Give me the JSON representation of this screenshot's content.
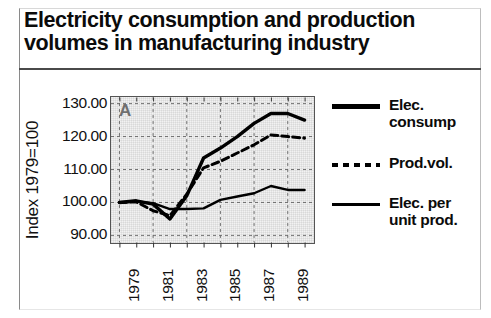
{
  "title": {
    "line1": "Electricity consumption and production",
    "line2": "volumes in manufacturing industry"
  },
  "panel_label": "A",
  "chart_data": {
    "type": "line",
    "title": "Electricity consumption and production volumes in manufacturing industry",
    "panel": "A",
    "xlabel": "",
    "ylabel": "Index 1979=100",
    "x": [
      1979,
      1980,
      1981,
      1982,
      1983,
      1984,
      1985,
      1986,
      1987,
      1988,
      1989,
      1990
    ],
    "xtick_labels": [
      "1979",
      "1981",
      "1983",
      "1985",
      "1987",
      "1989"
    ],
    "xtick_values": [
      1979,
      1981,
      1983,
      1985,
      1987,
      1989
    ],
    "ytick_labels": [
      "130.00",
      "120.00",
      "110.00",
      "100.00",
      "90.00"
    ],
    "ytick_values": [
      130,
      120,
      110,
      100,
      90
    ],
    "ylim": [
      88,
      132
    ],
    "xlim": [
      1978.5,
      1990.5
    ],
    "grid": true,
    "legend_position": "right",
    "series": [
      {
        "name": "Elec. consump",
        "label_lines": [
          "Elec.",
          "consump"
        ],
        "style": "thick-solid",
        "color": "#000000",
        "values": [
          100.0,
          100.5,
          99.5,
          95.0,
          102.0,
          113.5,
          116.5,
          120.0,
          124.0,
          127.0,
          127.0,
          125.0
        ]
      },
      {
        "name": "Prod.vol.",
        "label_lines": [
          "Prod.vol."
        ],
        "style": "dashed",
        "color": "#000000",
        "values": [
          100.0,
          100.2,
          97.5,
          96.0,
          102.5,
          110.5,
          112.5,
          115.0,
          117.5,
          120.5,
          120.0,
          119.5
        ]
      },
      {
        "name": "Elec. per unit prod.",
        "label_lines": [
          "Elec. per",
          "unit prod."
        ],
        "style": "thin-solid",
        "color": "#000000",
        "values": [
          100.0,
          100.3,
          99.8,
          98.0,
          98.0,
          98.2,
          100.8,
          101.8,
          102.8,
          105.0,
          103.8,
          103.8
        ]
      }
    ]
  },
  "legend": {
    "items": [
      {
        "swatch": "thick-solid",
        "lines": [
          "Elec.",
          "consump"
        ]
      },
      {
        "swatch": "dashed",
        "lines": [
          "Prod.vol."
        ]
      },
      {
        "swatch": "thin-solid",
        "lines": [
          "Elec. per",
          "unit prod."
        ]
      }
    ]
  }
}
